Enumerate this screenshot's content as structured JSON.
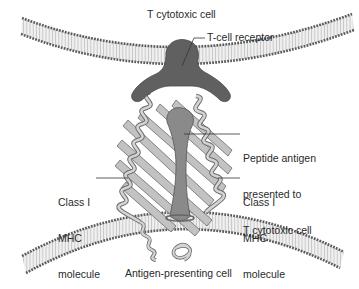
{
  "diagram": {
    "colors": {
      "background": "#ffffff",
      "membrane_head": "#5a5a5a",
      "membrane_tail": "#d9d9d9",
      "tcell_receptor": "#606060",
      "peptide": "#8a8a8a",
      "mhc_ribbon_fill": "#bdbdbd",
      "mhc_ribbon_stroke": "#6b6b6b",
      "leader_line": "#333333",
      "text": "#2a2a2a"
    },
    "labels": {
      "t_cytotoxic_cell": "T cytotoxic cell",
      "t_cell_receptor": "T-cell receptor",
      "peptide_antigen": [
        "Peptide antigen",
        "presented to",
        "T cytotoxic cell"
      ],
      "class1_mhc_left": [
        "Class I",
        "MHC",
        "molecule"
      ],
      "class1_mhc_right": [
        "Class I",
        "MHC",
        "molecule"
      ],
      "antigen_presenting_cell": "Antigen-presenting cell"
    },
    "nodes": [
      {
        "id": "t-cytotoxic-cell-membrane",
        "type": "lipid-bilayer",
        "position": "top"
      },
      {
        "id": "t-cell-receptor",
        "type": "receptor"
      },
      {
        "id": "peptide-antigen",
        "type": "peptide"
      },
      {
        "id": "class-1-mhc-molecule",
        "type": "protein-ribbon"
      },
      {
        "id": "antigen-presenting-cell-membrane",
        "type": "lipid-bilayer",
        "position": "bottom"
      }
    ],
    "edges": [
      {
        "from": "t-cell-receptor",
        "to": "peptide-antigen",
        "relation": "binds"
      },
      {
        "from": "class-1-mhc-molecule",
        "to": "peptide-antigen",
        "relation": "presents"
      }
    ]
  }
}
